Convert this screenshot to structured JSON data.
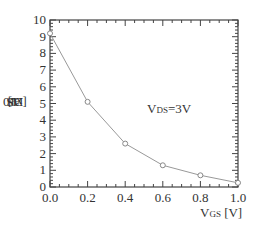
{
  "chart_data": {
    "type": "line",
    "title": "",
    "xlabel": "VGS [V]",
    "ylabel": "IDS [x10^-6 A]",
    "annotation": "VDS=3V",
    "x": [
      0.0,
      0.2,
      0.4,
      0.6,
      0.8,
      1.0
    ],
    "series": [
      {
        "name": "IDS",
        "values": [
          9.2,
          5.1,
          2.6,
          1.3,
          0.7,
          0.25
        ]
      }
    ],
    "xlim": [
      0.0,
      1.0
    ],
    "ylim": [
      0,
      10
    ],
    "xticks": [
      "0.0",
      "0.2",
      "0.4",
      "0.6",
      "0.8",
      "1.0"
    ],
    "yticks": [
      "0",
      "1",
      "2",
      "3",
      "4",
      "5",
      "6",
      "7",
      "8",
      "9",
      "10"
    ],
    "grid": false,
    "marker": "open-circle",
    "line_color": "#999999"
  },
  "labels": {
    "y_main": "I",
    "y_sub": "DS",
    "y_unit_pre": " [x10",
    "y_exp": "-6",
    "y_unit_post": "A]",
    "annot_main": "V",
    "annot_sub": "DS",
    "annot_rest": "=3V",
    "x_main": "V",
    "x_sub": "GS",
    "x_unit": " [V]"
  }
}
